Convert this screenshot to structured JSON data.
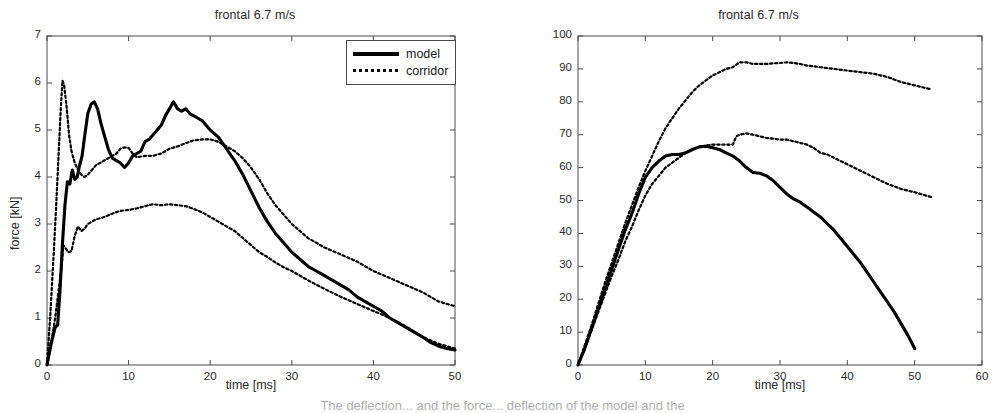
{
  "figure": {
    "bottom_caption": "The deflection... and the force... deflection of the model and the"
  },
  "panels": [
    {
      "id": "force",
      "title": "frontal 6.7 m/s",
      "xlabel": "time [ms]",
      "ylabel": "force [kN]",
      "legend": [
        {
          "label": "model",
          "style": "solid"
        },
        {
          "label": "corridor",
          "style": "dotted"
        }
      ],
      "xticks": [
        "0",
        "10",
        "20",
        "30",
        "40",
        "50"
      ],
      "yticks": [
        "0",
        "1",
        "2",
        "3",
        "4",
        "5",
        "6",
        "7"
      ]
    },
    {
      "id": "deflection",
      "title": "frontal 6.7 m/s",
      "xlabel": "time [ms]",
      "ylabel": "deflection [mm]",
      "legend": [
        {
          "label": "model",
          "style": "solid"
        },
        {
          "label": "corridor",
          "style": "dotted"
        }
      ],
      "xticks": [
        "0",
        "10",
        "20",
        "30",
        "40",
        "50",
        "60"
      ],
      "yticks": [
        "0",
        "10",
        "20",
        "30",
        "40",
        "50",
        "60",
        "70",
        "80",
        "90",
        "100"
      ]
    }
  ],
  "chart_data": [
    {
      "type": "line",
      "id": "force",
      "title": "frontal 6.7 m/s",
      "xlabel": "time [ms]",
      "ylabel": "force [kN]",
      "xlim": [
        0,
        50
      ],
      "ylim": [
        0,
        7
      ],
      "xticks": [
        0,
        10,
        20,
        30,
        40,
        50
      ],
      "yticks": [
        0,
        1,
        2,
        3,
        4,
        5,
        6,
        7
      ],
      "grid": false,
      "legend_position": "upper right",
      "series": [
        {
          "name": "model",
          "style": "solid",
          "x": [
            0.0,
            0.5,
            1.0,
            1.3,
            1.6,
            1.9,
            2.2,
            2.5,
            2.8,
            3.1,
            3.4,
            3.7,
            4.0,
            4.3,
            4.6,
            5.0,
            5.4,
            5.8,
            6.2,
            6.6,
            7.0,
            7.5,
            8.0,
            8.5,
            9.0,
            9.5,
            10.0,
            10.5,
            11.0,
            11.5,
            12.0,
            12.5,
            13.0,
            13.5,
            14.0,
            14.5,
            15.0,
            15.5,
            16.0,
            16.5,
            17.0,
            17.5,
            18.0,
            18.5,
            19.0,
            20.0,
            21.0,
            22.0,
            23.0,
            24.0,
            25.0,
            26.0,
            27.0,
            28.0,
            29.0,
            30.0,
            31.0,
            32.0,
            33.0,
            34.0,
            35.0,
            36.0,
            37.0,
            38.0,
            39.0,
            40.0,
            41.0,
            42.0,
            43.0,
            44.0,
            45.0,
            46.0,
            47.0,
            48.0,
            49.0,
            50.0
          ],
          "y": [
            0.0,
            0.45,
            0.8,
            0.85,
            1.6,
            2.6,
            3.4,
            3.9,
            3.85,
            4.15,
            3.95,
            4.0,
            4.25,
            4.45,
            4.85,
            5.35,
            5.55,
            5.6,
            5.45,
            5.15,
            4.9,
            4.6,
            4.4,
            4.35,
            4.3,
            4.2,
            4.3,
            4.45,
            4.5,
            4.55,
            4.75,
            4.8,
            4.9,
            5.0,
            5.1,
            5.3,
            5.45,
            5.6,
            5.45,
            5.4,
            5.45,
            5.35,
            5.3,
            5.25,
            5.2,
            5.0,
            4.85,
            4.6,
            4.35,
            4.05,
            3.7,
            3.35,
            3.05,
            2.8,
            2.6,
            2.4,
            2.25,
            2.1,
            2.0,
            1.9,
            1.8,
            1.7,
            1.6,
            1.45,
            1.35,
            1.25,
            1.15,
            1.0,
            0.9,
            0.8,
            0.7,
            0.6,
            0.48,
            0.4,
            0.35,
            0.32
          ]
        },
        {
          "name": "corridor-upper",
          "style": "dotted",
          "x": [
            0.0,
            0.4,
            0.8,
            1.1,
            1.4,
            1.7,
            1.9,
            2.1,
            2.4,
            2.7,
            3.0,
            3.4,
            3.8,
            4.2,
            4.6,
            5.0,
            5.5,
            6.0,
            6.5,
            7.0,
            7.5,
            8.0,
            8.5,
            9.0,
            9.5,
            10.0,
            10.5,
            11.0,
            12.0,
            13.0,
            14.0,
            15.0,
            16.0,
            17.0,
            18.0,
            19.0,
            20.0,
            21.0,
            22.0,
            23.0,
            24.0,
            25.0,
            26.0,
            27.0,
            28.0,
            29.0,
            30.0,
            32.0,
            34.0,
            36.0,
            38.0,
            40.0,
            42.0,
            44.0,
            46.0,
            48.0,
            50.0
          ],
          "y": [
            0.0,
            1.05,
            2.3,
            3.3,
            4.4,
            5.5,
            6.05,
            5.95,
            5.5,
            4.9,
            4.55,
            4.3,
            4.15,
            4.05,
            4.0,
            4.05,
            4.15,
            4.25,
            4.3,
            4.35,
            4.4,
            4.45,
            4.5,
            4.6,
            4.63,
            4.62,
            4.5,
            4.42,
            4.45,
            4.45,
            4.5,
            4.6,
            4.65,
            4.72,
            4.78,
            4.8,
            4.8,
            4.75,
            4.65,
            4.55,
            4.4,
            4.2,
            3.95,
            3.65,
            3.4,
            3.2,
            3.0,
            2.7,
            2.5,
            2.35,
            2.2,
            2.0,
            1.85,
            1.7,
            1.55,
            1.35,
            1.25
          ]
        },
        {
          "name": "corridor-lower",
          "style": "dotted",
          "x": [
            0.0,
            0.5,
            1.0,
            1.4,
            1.8,
            2.0,
            2.3,
            2.6,
            3.0,
            3.4,
            3.8,
            4.2,
            4.6,
            5.0,
            5.5,
            6.0,
            6.5,
            7.0,
            8.0,
            9.0,
            10.0,
            11.0,
            12.0,
            13.0,
            14.0,
            15.0,
            16.0,
            17.0,
            18.0,
            19.0,
            20.0,
            21.0,
            22.0,
            23.0,
            24.0,
            25.0,
            26.0,
            27.0,
            28.0,
            29.0,
            30.0,
            32.0,
            34.0,
            36.0,
            38.0,
            40.0,
            42.0,
            44.0,
            46.0,
            48.0,
            50.0
          ],
          "y": [
            0.0,
            0.45,
            1.0,
            1.55,
            2.1,
            2.55,
            2.48,
            2.4,
            2.42,
            2.75,
            2.95,
            2.85,
            2.9,
            3.0,
            3.05,
            3.1,
            3.12,
            3.15,
            3.22,
            3.28,
            3.3,
            3.33,
            3.38,
            3.42,
            3.4,
            3.42,
            3.4,
            3.38,
            3.32,
            3.25,
            3.15,
            3.05,
            2.95,
            2.85,
            2.7,
            2.55,
            2.4,
            2.3,
            2.18,
            2.08,
            2.0,
            1.8,
            1.62,
            1.45,
            1.3,
            1.15,
            1.0,
            0.82,
            0.6,
            0.45,
            0.35
          ]
        }
      ]
    },
    {
      "type": "line",
      "id": "deflection",
      "title": "frontal 6.7 m/s",
      "xlabel": "time [ms]",
      "ylabel": "deflection [mm]",
      "xlim": [
        0,
        60
      ],
      "ylim": [
        0,
        100
      ],
      "xticks": [
        0,
        10,
        20,
        30,
        40,
        50,
        60
      ],
      "yticks": [
        0,
        10,
        20,
        30,
        40,
        50,
        60,
        70,
        80,
        90,
        100
      ],
      "grid": false,
      "legend_position": "upper right",
      "series": [
        {
          "name": "model",
          "style": "solid",
          "x": [
            0,
            1,
            2,
            3,
            4,
            5,
            6,
            7,
            8,
            9,
            10,
            11,
            12,
            13,
            14,
            15,
            16,
            17,
            18,
            19,
            20,
            21,
            22,
            23,
            24,
            25,
            26,
            27,
            28,
            29,
            30,
            31,
            32,
            33,
            34,
            35,
            36,
            37,
            38,
            39,
            40,
            41,
            42,
            43,
            44,
            45,
            46,
            47,
            48,
            49,
            50
          ],
          "y": [
            0,
            5,
            11,
            17,
            23,
            29,
            35,
            41,
            46,
            52,
            57,
            60,
            62,
            63.5,
            64,
            64,
            64.5,
            65.5,
            66.3,
            66.5,
            66,
            65.5,
            64.5,
            63.5,
            62,
            60,
            58.5,
            58.3,
            57.5,
            56,
            54,
            52,
            50.5,
            49.5,
            48,
            46.5,
            45,
            43,
            41,
            38.5,
            36,
            33.5,
            31,
            28,
            25,
            22,
            19,
            16,
            12.5,
            9,
            5
          ]
        },
        {
          "name": "corridor-upper",
          "style": "dotted",
          "x": [
            0,
            1,
            2,
            3,
            4,
            5,
            6,
            7,
            8,
            9,
            10,
            11,
            12,
            13,
            14,
            15,
            16,
            17,
            18,
            19,
            20,
            21,
            22,
            23,
            24,
            25,
            26,
            27,
            28,
            29,
            30,
            31,
            32,
            33,
            34,
            35,
            36,
            38,
            40,
            42,
            44,
            46,
            48,
            50,
            52,
            52.5
          ],
          "y": [
            0,
            6,
            12,
            18.5,
            25,
            31,
            37,
            43,
            48.5,
            54,
            59,
            63.5,
            68,
            72,
            75,
            78,
            80.5,
            83,
            85,
            86.5,
            88,
            89,
            90,
            90.5,
            92,
            92,
            91.5,
            91.5,
            91.5,
            91.7,
            91.8,
            92,
            91.8,
            91.5,
            91,
            90.8,
            90.5,
            90,
            89.5,
            89,
            88.5,
            87.5,
            86,
            85,
            84,
            83.8
          ]
        },
        {
          "name": "corridor-lower",
          "style": "dotted",
          "x": [
            0,
            1,
            2,
            3,
            4,
            5,
            6,
            7,
            8,
            9,
            10,
            11,
            12,
            13,
            14,
            15,
            16,
            17,
            18,
            19,
            20,
            21,
            22,
            23,
            23.5,
            24,
            25,
            26,
            27,
            28,
            29,
            30,
            31,
            32,
            33,
            34,
            35,
            36,
            37,
            38,
            40,
            42,
            44,
            46,
            48,
            50,
            52,
            52.5
          ],
          "y": [
            0,
            5,
            10.5,
            16,
            21.5,
            27,
            32,
            37.5,
            42,
            47,
            51.5,
            55,
            57.5,
            60,
            61.5,
            63,
            64.5,
            65.5,
            66.3,
            66.7,
            67,
            67,
            67,
            67,
            69.5,
            70,
            70.4,
            70,
            69.5,
            69,
            68.8,
            68.5,
            68.5,
            68,
            67.5,
            67,
            66,
            64.5,
            64,
            63,
            61,
            59,
            57,
            55,
            53.5,
            52.5,
            51.3,
            51
          ]
        }
      ]
    }
  ]
}
